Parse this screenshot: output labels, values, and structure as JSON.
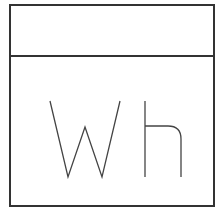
{
  "card": {
    "header_text": "",
    "glyph_text": "Wh",
    "border_color": "#333333",
    "stroke_color": "#444444",
    "background": "#ffffff"
  }
}
